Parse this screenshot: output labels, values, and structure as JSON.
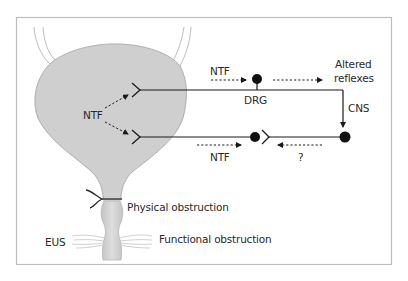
{
  "figure": {
    "frame_color": "#bdbdbd",
    "bladder_fill": "#cfcfcf",
    "bladder_stroke": "#a8a8a8",
    "line_color": "#1a1a1a"
  },
  "labels": {
    "ntf_bladder": "NTF",
    "ntf_upper": "NTF",
    "ntf_lower": "NTF",
    "drg": "DRG",
    "altered_reflexes_line1": "Altered",
    "altered_reflexes_line2": "reflexes",
    "cns": "CNS",
    "question": "?",
    "physical_obstruction": "Physical obstruction",
    "functional_obstruction": "Functional obstruction",
    "eus": "EUS"
  }
}
